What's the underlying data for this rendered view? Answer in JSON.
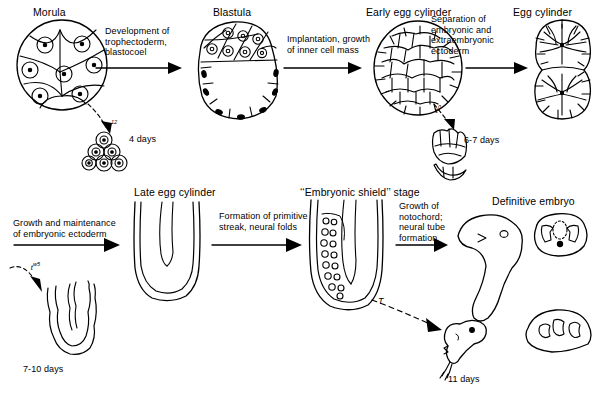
{
  "figure": {
    "domain_kind": "biology-development-diagram",
    "background_color": "#ffffff",
    "line_color": "#000000"
  },
  "row1": {
    "stages": [
      {
        "id": "morula",
        "label": "Morula"
      },
      {
        "id": "blastula",
        "label": "Blastula"
      },
      {
        "id": "early-egg-cylinder",
        "label": "Early egg cylinder"
      },
      {
        "id": "egg-cylinder",
        "label": "Egg cylinder"
      }
    ],
    "transitions": [
      {
        "id": "t1",
        "text": "Development of\ntrophectoderm,\nblastocoel"
      },
      {
        "id": "t2",
        "text": "Implantation, growth\nof inner cell mass"
      },
      {
        "id": "t3",
        "text": "Separation of\nembryonic and\nextraembryonic\nectoderm"
      }
    ],
    "arrests": [
      {
        "id": "arrest-t12",
        "genotype": "t",
        "exponent": "12",
        "day_label": "4 days"
      },
      {
        "id": "arrest-t0",
        "genotype": "t",
        "exponent": "0",
        "day_label": "6-7 days"
      }
    ]
  },
  "row2": {
    "stages": [
      {
        "id": "late-egg-cylinder",
        "label": "Late egg cylinder"
      },
      {
        "id": "embryonic-shield",
        "label": "‘‘Embryonic shield’’ stage"
      },
      {
        "id": "definitive-embryo",
        "label": "Definitive embryo"
      }
    ],
    "transitions": [
      {
        "id": "t4",
        "text": "Growth and maintenance\nof embryonic ectoderm"
      },
      {
        "id": "t5",
        "text": "Formation of primitive\nstreak, neural folds"
      },
      {
        "id": "t6",
        "text": "Growth of\nnotochord;\nneural tube\nformation"
      }
    ],
    "arrests": [
      {
        "id": "arrest-tw5",
        "genotype": "t",
        "exponent": "w5",
        "day_label": "7-10 days"
      },
      {
        "id": "arrest-T",
        "genotype": "T",
        "exponent": "",
        "day_label": "11 days"
      }
    ]
  }
}
